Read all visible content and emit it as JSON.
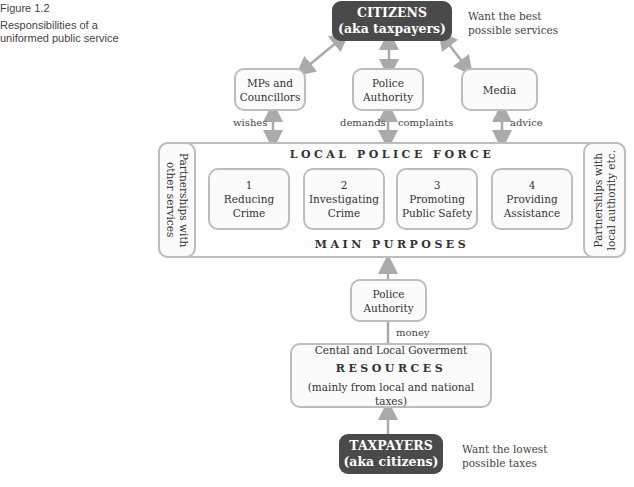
{
  "figure": {
    "number": "Figure 1.2",
    "caption_line1": "Responsibilities of a",
    "caption_line2": "uniformed public service"
  },
  "citizens": {
    "title": "CITIZENS",
    "subtitle": "(aka taxpayers)",
    "note_line1": "Want the best",
    "note_line2": "possible services"
  },
  "stakeholders": [
    {
      "line1": "MPs and",
      "line2": "Councillors",
      "link_label": "wishes"
    },
    {
      "line1": "Police",
      "line2": "Authority",
      "link_label_left": "demands",
      "link_label_right": "complaints"
    },
    {
      "line1": "Media",
      "line2": "",
      "link_label": "advice"
    }
  ],
  "police_force": {
    "title": "LOCAL POLICE FORCE",
    "footer": "MAIN PURPOSES",
    "left_partnership_line1": "Partnerships with",
    "left_partnership_line2": "other services",
    "right_partnership_line1": "Partnerships with",
    "right_partnership_line2": "local authority etc.",
    "purposes": [
      {
        "number": "1",
        "line1": "Reducing",
        "line2": "Crime"
      },
      {
        "number": "2",
        "line1": "Investigating",
        "line2": "Crime"
      },
      {
        "number": "3",
        "line1": "Promoting",
        "line2": "Public Safety"
      },
      {
        "number": "4",
        "line1": "Providing",
        "line2": "Assistance"
      }
    ]
  },
  "funding": {
    "authority_line1": "Police",
    "authority_line2": "Authority",
    "money_label": "money"
  },
  "resources": {
    "line1": "Cental and Local Goverment",
    "title": "RESOURCES",
    "line3": "(mainly from local and national taxes)"
  },
  "taxpayers": {
    "title": "TAXPAYERS",
    "subtitle": "(aka citizens)",
    "note_line1": "Want the lowest",
    "note_line2": "possible taxes"
  },
  "colors": {
    "dark_box": "#4a4a4a",
    "border_gray": "#bdbdbd",
    "arrow_gray": "#aaaaaa"
  }
}
